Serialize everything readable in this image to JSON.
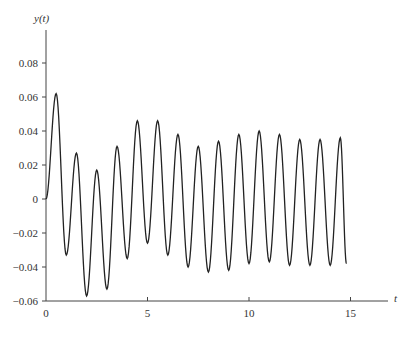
{
  "chart_data": {
    "type": "line",
    "title": "",
    "xlabel": "t",
    "ylabel": "y(t)",
    "xlim": [
      0,
      16.5
    ],
    "ylim": [
      -0.06,
      0.095
    ],
    "grid": false,
    "legend": null,
    "x_ticks": [
      "0",
      "5",
      "10",
      "15"
    ],
    "y_ticks": [
      "0.08",
      "0.06",
      "0.04",
      "0.02",
      "0",
      "-0.02",
      "-0.04",
      "-0.06"
    ],
    "series": [
      {
        "name": "y(t)",
        "color": "#222222",
        "extrema": [
          [
            0,
            0
          ],
          [
            0.5,
            0.062
          ],
          [
            1.0,
            -0.033
          ],
          [
            1.5,
            0.027
          ],
          [
            2.0,
            -0.057
          ],
          [
            2.5,
            0.017
          ],
          [
            3.0,
            -0.053
          ],
          [
            3.5,
            0.031
          ],
          [
            4.0,
            -0.035
          ],
          [
            4.5,
            0.046
          ],
          [
            5.0,
            -0.026
          ],
          [
            5.5,
            0.046
          ],
          [
            6.0,
            -0.033
          ],
          [
            6.5,
            0.038
          ],
          [
            7.0,
            -0.04
          ],
          [
            7.5,
            0.031
          ],
          [
            8.0,
            -0.043
          ],
          [
            8.5,
            0.034
          ],
          [
            9.0,
            -0.042
          ],
          [
            9.5,
            0.038
          ],
          [
            10.0,
            -0.038
          ],
          [
            10.5,
            0.04
          ],
          [
            11.0,
            -0.037
          ],
          [
            11.5,
            0.038
          ],
          [
            12.0,
            -0.039
          ],
          [
            12.5,
            0.035
          ],
          [
            13.0,
            -0.039
          ],
          [
            13.5,
            0.035
          ],
          [
            14.0,
            -0.039
          ],
          [
            14.5,
            0.036
          ],
          [
            14.8,
            -0.038
          ]
        ]
      }
    ]
  }
}
